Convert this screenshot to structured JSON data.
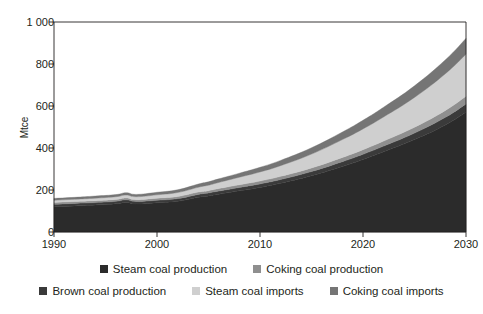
{
  "chart_data": {
    "type": "area",
    "stacked": true,
    "title": "1990-2030",
    "xlabel": "",
    "ylabel": "Mtce",
    "xlim": [
      1990,
      2030
    ],
    "ylim": [
      0,
      1000
    ],
    "xticks": [
      1990,
      2000,
      2010,
      2020,
      2030
    ],
    "xtick_labels": [
      "1990",
      "2000",
      "2010",
      "2020",
      "2030"
    ],
    "yticks": [
      0,
      200,
      400,
      600,
      800,
      1000
    ],
    "ytick_labels": [
      "0",
      "200",
      "400",
      "600",
      "800",
      "1 000"
    ],
    "grid": false,
    "legend_position": "bottom",
    "x": [
      1990,
      1992,
      1994,
      1996,
      1997,
      1998,
      2000,
      2002,
      2004,
      2005,
      2006,
      2008,
      2010,
      2012,
      2015,
      2018,
      2020,
      2022,
      2025,
      2028,
      2030
    ],
    "series": [
      {
        "name": "Steam coal production",
        "color": "#2b2b2b",
        "values": [
          120,
          124,
          128,
          134,
          141,
          133,
          139,
          146,
          165,
          172,
          180,
          196,
          212,
          232,
          268,
          312,
          345,
          382,
          440,
          510,
          570
        ]
      },
      {
        "name": "Brown coal production",
        "color": "#3a3a3a",
        "values": [
          12,
          12,
          12,
          12,
          12,
          12,
          12,
          13,
          14,
          14,
          15,
          16,
          17,
          18,
          20,
          23,
          25,
          27,
          31,
          36,
          40
        ]
      },
      {
        "name": "Coking coal production",
        "color": "#8f8f8f",
        "values": [
          9,
          9,
          9,
          9,
          9,
          9,
          10,
          10,
          11,
          11,
          12,
          13,
          14,
          15,
          17,
          20,
          22,
          24,
          28,
          33,
          37
        ]
      },
      {
        "name": "Steam coal imports",
        "color": "#cfcfcf",
        "values": [
          10,
          11,
          12,
          13,
          14,
          14,
          16,
          19,
          23,
          26,
          29,
          36,
          43,
          51,
          66,
          85,
          99,
          115,
          142,
          175,
          200
        ]
      },
      {
        "name": "Coking coal imports",
        "color": "#757575",
        "values": [
          9,
          9,
          10,
          10,
          11,
          11,
          12,
          13,
          15,
          16,
          17,
          19,
          22,
          25,
          30,
          36,
          41,
          46,
          55,
          66,
          75
        ]
      }
    ],
    "legend_entries": [
      {
        "label": "Steam coal production",
        "color": "#2b2b2b"
      },
      {
        "label": "Coking coal production",
        "color": "#8f8f8f"
      },
      {
        "label": "Brown coal production",
        "color": "#3a3a3a"
      },
      {
        "label": "Steam coal imports",
        "color": "#cfcfcf"
      },
      {
        "label": "Coking coal imports",
        "color": "#757575"
      }
    ],
    "colors": {
      "axis": "#231f20",
      "background": "#ffffff"
    }
  }
}
